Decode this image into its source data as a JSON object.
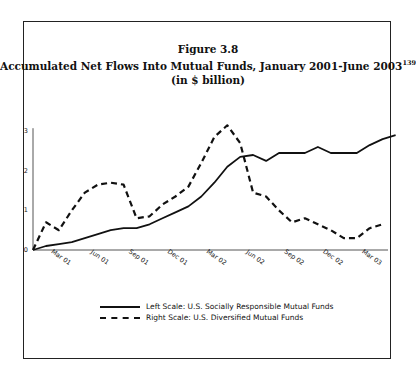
{
  "figure": {
    "label": "Figure 3.8",
    "title": "Accumulated Net Flows Into Mutual Funds, January 2001-June 2003",
    "footnote_ref": "139",
    "subtitle": "(in $ billion)"
  },
  "legend": {
    "items": [
      {
        "label": "Left Scale: U.S. Socially Responsible Mutual Funds",
        "style": "solid"
      },
      {
        "label": "Right Scale: U.S. Diversified Mutual Funds",
        "style": "dashed"
      }
    ]
  },
  "chart_data": {
    "type": "line",
    "title": "Accumulated Net Flows Into Mutual Funds, January 2001-June 2003",
    "subtitle": "(in $ billion)",
    "xlabel": "",
    "ylabel": "",
    "ylim": [
      0,
      3
    ],
    "yticks": [
      0,
      1,
      2,
      3
    ],
    "xtick_labels": [
      "Mar '01",
      "Jun '01",
      "Sep '01",
      "Dec '01",
      "Mar '02",
      "Jun '02",
      "Sep '02",
      "Dec '02",
      "Mar '03"
    ],
    "x": [
      "Jan '01",
      "Feb '01",
      "Mar '01",
      "Apr '01",
      "May '01",
      "Jun '01",
      "Jul '01",
      "Aug '01",
      "Sep '01",
      "Oct '01",
      "Nov '01",
      "Dec '01",
      "Jan '02",
      "Feb '02",
      "Mar '02",
      "Apr '02",
      "May '02",
      "Jun '02",
      "Jul '02",
      "Aug '02",
      "Sep '02",
      "Oct '02",
      "Nov '02",
      "Dec '02",
      "Jan '03",
      "Feb '03",
      "Mar '03",
      "Apr '03",
      "May '03"
    ],
    "series": [
      {
        "name": "Left Scale: U.S. Socially Responsible Mutual Funds",
        "style": "solid",
        "axis": "left",
        "values": [
          0,
          0.1,
          0.15,
          0.2,
          0.3,
          0.4,
          0.5,
          0.55,
          0.55,
          0.65,
          0.8,
          0.95,
          1.1,
          1.35,
          1.7,
          2.1,
          2.35,
          2.4,
          2.25,
          2.45,
          2.45,
          2.45,
          2.6,
          2.45,
          2.45,
          2.45,
          2.65,
          2.8,
          2.9
        ]
      },
      {
        "name": "Right Scale: U.S. Diversified Mutual Funds",
        "style": "dashed",
        "axis": "right",
        "values": [
          0,
          0.7,
          0.5,
          1.0,
          1.45,
          1.65,
          1.7,
          1.65,
          0.8,
          0.85,
          1.15,
          1.35,
          1.6,
          2.2,
          2.85,
          3.15,
          2.7,
          1.45,
          1.35,
          1.0,
          0.7,
          0.8,
          0.65,
          0.5,
          0.3,
          0.3,
          0.55,
          0.65,
          null
        ]
      }
    ],
    "grid": false,
    "legend_position": "bottom"
  }
}
